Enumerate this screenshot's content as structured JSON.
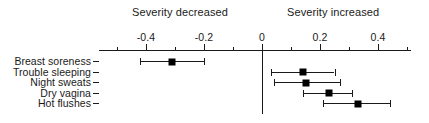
{
  "header": {
    "left_label": "Severity decreased",
    "right_label": "Severity increased"
  },
  "chart_data": {
    "type": "scatter",
    "title": "",
    "subtitle": "",
    "xlabel": "",
    "ylabel": "",
    "xlim": [
      -0.52,
      0.56
    ],
    "grid": false,
    "legend_position": "none",
    "annotations": [
      "Severity decreased",
      "Severity increased"
    ],
    "reference_line": 0,
    "xticks": [
      -0.4,
      -0.2,
      0,
      0.2,
      0.4
    ],
    "xtick_labels": [
      "-0.4",
      "-0.2",
      "0",
      "0.2",
      "0.4"
    ],
    "minor_xticks": [
      -0.5,
      -0.3,
      -0.1,
      0.1,
      0.3,
      0.5
    ],
    "categories": [
      "Breast soreness",
      "Trouble sleeping",
      "Night sweats",
      "Dry vagina",
      "Hot flushes"
    ],
    "values": [
      -0.31,
      0.14,
      0.15,
      0.23,
      0.33
    ],
    "ci_low": [
      -0.42,
      0.03,
      0.04,
      0.14,
      0.21
    ],
    "ci_high": [
      -0.2,
      0.25,
      0.27,
      0.31,
      0.44
    ],
    "series": [
      {
        "name": "Effect estimate",
        "points": [
          {
            "category": "Breast soreness",
            "value": -0.31,
            "ci_low": -0.42,
            "ci_high": -0.2
          },
          {
            "category": "Trouble sleeping",
            "value": 0.14,
            "ci_low": 0.03,
            "ci_high": 0.25
          },
          {
            "category": "Night sweats",
            "value": 0.15,
            "ci_low": 0.04,
            "ci_high": 0.27
          },
          {
            "category": "Dry vagina",
            "value": 0.23,
            "ci_low": 0.14,
            "ci_high": 0.31
          },
          {
            "category": "Hot flushes",
            "value": 0.33,
            "ci_low": 0.21,
            "ci_high": 0.44
          }
        ]
      }
    ]
  },
  "colors": {
    "marker": "#000000",
    "axis": "#1a1a1a",
    "background": "#ffffff"
  }
}
